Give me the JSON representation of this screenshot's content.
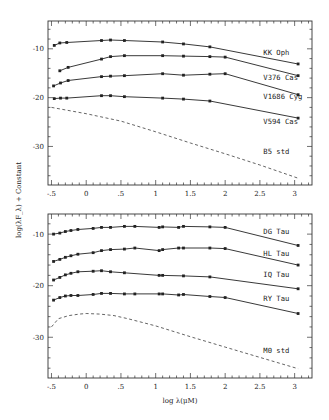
{
  "chart_data": [
    {
      "type": "line",
      "panel": "top",
      "title": "",
      "xlabel": "log λ(μM)",
      "ylabel": "log(λF_λ) + Constant",
      "xlim": [
        -0.55,
        3.25
      ],
      "ylim": [
        -37.9,
        -4.3
      ],
      "xticks": [
        -0.5,
        0,
        0.5,
        1,
        1.5,
        2,
        2.5,
        3
      ],
      "xtick_labels": [
        "-.5",
        "0",
        ".5",
        "1",
        "1.5",
        "2",
        "2.5",
        "3"
      ],
      "yticks": [
        -10,
        -20,
        -30
      ],
      "ytick_labels": [
        "-10",
        "-20",
        "-30"
      ],
      "grid": false,
      "legend": "inline labels at right",
      "series": [
        {
          "name": "KK Oph",
          "style": "solid-markers",
          "label_pos": [
            2.55,
            -11.2
          ],
          "x": [
            -0.46,
            -0.38,
            -0.28,
            0.22,
            0.35,
            0.55,
            1.1,
            1.4,
            1.78,
            3.05
          ],
          "y": [
            -9.3,
            -8.8,
            -8.7,
            -8.3,
            -8.2,
            -8.3,
            -8.6,
            -9.0,
            -9.6,
            -13.1
          ]
        },
        {
          "name": "V376 Cas",
          "style": "solid-markers",
          "label_pos": [
            2.55,
            -16.3
          ],
          "x": [
            -0.38,
            -0.26,
            0.22,
            0.35,
            0.55,
            1.1,
            1.4,
            1.78,
            2.0,
            3.05
          ],
          "y": [
            -14.5,
            -13.8,
            -12.1,
            -11.6,
            -11.4,
            -11.4,
            -11.5,
            -11.6,
            -11.7,
            -15.5
          ]
        },
        {
          "name": "V1686 Cyg",
          "style": "solid-markers",
          "label_pos": [
            2.55,
            -20.2
          ],
          "x": [
            -0.47,
            -0.37,
            -0.26,
            0.22,
            0.35,
            0.55,
            1.1,
            1.4,
            1.78,
            2.0,
            3.05
          ],
          "y": [
            -17.6,
            -17.0,
            -16.5,
            -15.7,
            -15.6,
            -15.5,
            -15.1,
            -15.4,
            -15.2,
            -15.1,
            -19.4
          ]
        },
        {
          "name": "V594 Cas",
          "style": "solid-markers",
          "label_pos": [
            2.55,
            -25.3
          ],
          "x": [
            -0.46,
            -0.37,
            -0.28,
            0.22,
            0.35,
            0.55,
            1.1,
            1.4,
            1.78,
            3.05
          ],
          "y": [
            -20.2,
            -20.1,
            -20.1,
            -19.6,
            -19.6,
            -19.8,
            -20.1,
            -20.3,
            -20.7,
            -24.2
          ]
        },
        {
          "name": "B5 std",
          "style": "dashed",
          "label_pos": [
            2.55,
            -31.5
          ],
          "x": [
            -0.5,
            0.0,
            0.5,
            1.0,
            1.5,
            2.0,
            2.5,
            3.05
          ],
          "y": [
            -22.0,
            -23.3,
            -24.8,
            -27.0,
            -29.3,
            -31.5,
            -33.8,
            -36.5
          ]
        }
      ]
    },
    {
      "type": "line",
      "panel": "bottom",
      "title": "",
      "xlabel": "log λ(μM)",
      "ylabel": "log(λF_λ) + Constant",
      "xlim": [
        -0.55,
        3.25
      ],
      "ylim": [
        -37.9,
        -6.1
      ],
      "xticks": [
        -0.5,
        0,
        0.5,
        1,
        1.5,
        2,
        2.5,
        3
      ],
      "xtick_labels": [
        "-.5",
        "0",
        ".5",
        "1",
        "1.5",
        "2",
        "2.5",
        "3"
      ],
      "yticks": [
        -10,
        -20,
        -30
      ],
      "ytick_labels": [
        "-10",
        "-20",
        "-30"
      ],
      "grid": false,
      "legend": "inline labels at right",
      "series": [
        {
          "name": "DG Tau",
          "style": "solid-markers",
          "label_pos": [
            2.55,
            -10.0
          ],
          "x": [
            -0.47,
            -0.38,
            -0.3,
            -0.22,
            -0.12,
            0.1,
            0.22,
            0.35,
            0.55,
            0.7,
            1.05,
            1.1,
            1.33,
            1.4,
            1.78,
            2.0,
            3.05
          ],
          "y": [
            -10.0,
            -9.8,
            -9.5,
            -9.3,
            -9.1,
            -8.9,
            -8.7,
            -8.7,
            -8.5,
            -8.5,
            -8.7,
            -8.6,
            -8.7,
            -8.5,
            -8.6,
            -8.7,
            -12.2
          ]
        },
        {
          "name": "HL Tau",
          "style": "solid-markers",
          "label_pos": [
            2.55,
            -14.3
          ],
          "x": [
            -0.47,
            -0.38,
            -0.3,
            -0.22,
            -0.12,
            0.1,
            0.22,
            0.35,
            0.55,
            0.7,
            1.05,
            1.1,
            1.33,
            1.4,
            1.78,
            2.0,
            3.05
          ],
          "y": [
            -15.3,
            -14.9,
            -14.5,
            -14.2,
            -13.9,
            -13.6,
            -13.2,
            -13.0,
            -12.9,
            -12.7,
            -13.2,
            -13.0,
            -12.7,
            -12.7,
            -12.7,
            -12.8,
            -16.0
          ]
        },
        {
          "name": "IQ Tau",
          "style": "solid-markers",
          "label_pos": [
            2.55,
            -18.4
          ],
          "x": [
            -0.47,
            -0.38,
            -0.3,
            -0.22,
            -0.12,
            0.1,
            0.22,
            0.35,
            0.55,
            1.05,
            1.1,
            1.4,
            1.78,
            3.05
          ],
          "y": [
            -18.9,
            -18.4,
            -17.9,
            -17.6,
            -17.3,
            -17.2,
            -17.1,
            -17.3,
            -17.5,
            -18.0,
            -18.0,
            -18.1,
            -18.3,
            -20.6
          ]
        },
        {
          "name": "RY Tau",
          "style": "solid-markers",
          "label_pos": [
            2.55,
            -22.9
          ],
          "x": [
            -0.47,
            -0.38,
            -0.3,
            -0.22,
            -0.12,
            0.1,
            0.22,
            0.35,
            0.55,
            0.7,
            1.05,
            1.1,
            1.33,
            1.4,
            1.78,
            2.0,
            3.05
          ],
          "y": [
            -22.8,
            -22.3,
            -22.0,
            -21.9,
            -21.9,
            -21.7,
            -21.5,
            -21.5,
            -21.6,
            -21.6,
            -21.6,
            -21.6,
            -21.8,
            -21.7,
            -22.1,
            -22.3,
            -25.4
          ]
        },
        {
          "name": "M0 std",
          "style": "dashed",
          "label_pos": [
            2.55,
            -33.0
          ],
          "x": [
            -0.5,
            -0.4,
            -0.25,
            -0.1,
            0.0,
            0.2,
            0.4,
            0.6,
            1.0,
            1.5,
            2.0,
            2.5,
            3.05
          ],
          "y": [
            -28.0,
            -26.4,
            -25.8,
            -25.5,
            -25.4,
            -25.5,
            -25.8,
            -26.4,
            -27.8,
            -29.9,
            -31.9,
            -33.9,
            -36.1
          ]
        }
      ]
    }
  ],
  "axes": {
    "ylabel": "log(λF_λ) + Constant",
    "xlabel": "log λ(μM)"
  },
  "colors": {
    "line": "#222222",
    "frame": "#333333",
    "background": "#ffffff"
  }
}
